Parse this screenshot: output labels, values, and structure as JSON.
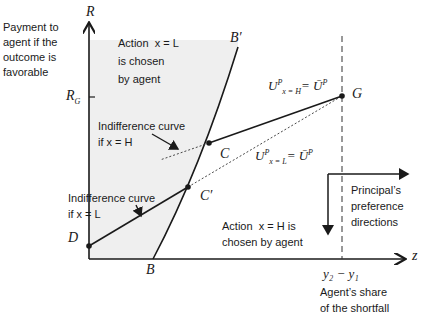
{
  "diagram": {
    "y_axis_title": "Payment to\nagent if the\noutcome is\nfavorable",
    "y_axis_symbol": "R",
    "x_axis_symbol": "z",
    "r_g_label": "R",
    "r_g_sub": "G",
    "region_left_label": "Action  x = L\nis chosen\nby agent",
    "region_right_label": "Action  x = H is\nchosen by agent",
    "indiff_h_label": "Indifference curve\nif x = H",
    "indiff_l_label": "Indifference curve\nif x = L",
    "point_labels": {
      "D": "D",
      "B": "B",
      "B_prime": "B′",
      "C": "C",
      "C_prime": "C′",
      "G": "G"
    },
    "u_h_label": {
      "main": "U",
      "sup": "P",
      "sub": "x = H",
      "rhs": "= Ū",
      "rhs_sup": "P"
    },
    "u_l_label": {
      "main": "U",
      "sup": "P",
      "sub": "x = L",
      "rhs": "= Ū",
      "rhs_sup": "P"
    },
    "principal_pref_label": "Principal’s\npreference\ndirections",
    "x_tick_label": "y₂ − y₁",
    "x_tick_caption": "Agent’s share\nof the shortfall",
    "colors": {
      "shaded_region": "#efefef",
      "line": "#1a1a1a"
    }
  }
}
